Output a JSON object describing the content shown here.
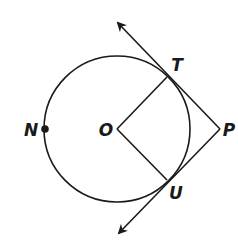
{
  "diagram": {
    "type": "circle-with-tangents",
    "stroke_color": "#1a1a1a",
    "background": "#ffffff",
    "circle": {
      "center": "O",
      "cx": 117,
      "cy": 129,
      "r": 73
    },
    "points": {
      "N": {
        "label": "N",
        "x": 45,
        "y": 129,
        "label_x": 30,
        "label_y": 129,
        "marked": true
      },
      "O": {
        "label": "O",
        "x": 117,
        "y": 129,
        "label_x": 106,
        "label_y": 129
      },
      "T": {
        "label": "T",
        "x": 167,
        "y": 77,
        "label_x": 177,
        "label_y": 64
      },
      "U": {
        "label": "U",
        "x": 167,
        "y": 180,
        "label_x": 176,
        "label_y": 193
      },
      "P": {
        "label": "P",
        "x": 220,
        "y": 129,
        "label_x": 229,
        "label_y": 129
      }
    },
    "segments": [
      {
        "from": "O",
        "to": "T"
      },
      {
        "from": "O",
        "to": "U"
      }
    ],
    "rays": [
      {
        "from": "P",
        "through": "T",
        "arrow_tip": {
          "x": 114,
          "y": 19
        }
      },
      {
        "from": "P",
        "through": "U",
        "arrow_tip": {
          "x": 115,
          "y": 237
        }
      }
    ]
  }
}
